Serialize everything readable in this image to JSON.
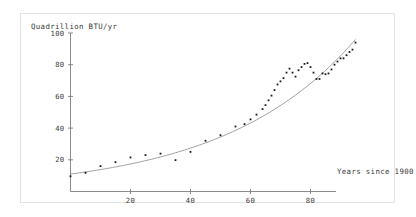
{
  "chart_data": {
    "type": "scatter",
    "title": "",
    "ylabel": "Quadrillion BTU/yr",
    "xlabel": "Years since 1900",
    "xlim": [
      0,
      95
    ],
    "ylim": [
      0,
      100
    ],
    "grid": false,
    "legend": null,
    "yticks": [
      20,
      40,
      60,
      80,
      100
    ],
    "xticks": [
      20,
      40,
      60,
      80
    ],
    "series": [
      {
        "name": "Observed energy consumption",
        "marker": "point",
        "color": "#1a1a1a",
        "points": [
          [
            0,
            9.6
          ],
          [
            5,
            11.8
          ],
          [
            10,
            16.0
          ],
          [
            15,
            18.5
          ],
          [
            20,
            21.5
          ],
          [
            25,
            23.0
          ],
          [
            30,
            23.9
          ],
          [
            35,
            19.8
          ],
          [
            40,
            25.0
          ],
          [
            45,
            32.0
          ],
          [
            50,
            35.5
          ],
          [
            55,
            41.0
          ],
          [
            58,
            42.5
          ],
          [
            60,
            45.5
          ],
          [
            62,
            48.5
          ],
          [
            64,
            52.0
          ],
          [
            65,
            54.5
          ],
          [
            66,
            57.5
          ],
          [
            67,
            60.5
          ],
          [
            68,
            64.0
          ],
          [
            69,
            67.5
          ],
          [
            70,
            69.5
          ],
          [
            71,
            71.5
          ],
          [
            72,
            75.0
          ],
          [
            73,
            77.5
          ],
          [
            74,
            75.0
          ],
          [
            75,
            72.5
          ],
          [
            76,
            76.5
          ],
          [
            77,
            78.5
          ],
          [
            78,
            80.5
          ],
          [
            79,
            81.0
          ],
          [
            80,
            78.5
          ],
          [
            81,
            75.0
          ],
          [
            82,
            71.0
          ],
          [
            83,
            71.0
          ],
          [
            84,
            74.5
          ],
          [
            85,
            74.0
          ],
          [
            86,
            74.5
          ],
          [
            87,
            77.0
          ],
          [
            88,
            80.0
          ],
          [
            89,
            82.0
          ],
          [
            90,
            84.0
          ],
          [
            91,
            84.0
          ],
          [
            92,
            86.0
          ],
          [
            93,
            88.0
          ],
          [
            94,
            89.5
          ],
          [
            95,
            94.0
          ]
        ]
      }
    ],
    "fit_curve": {
      "name": "Exponential fit",
      "color": "#808080",
      "formula": "y = 11 * exp(0.0228 * x)",
      "a": 11.0,
      "b": 0.0228,
      "x_range": [
        0,
        95
      ]
    }
  }
}
